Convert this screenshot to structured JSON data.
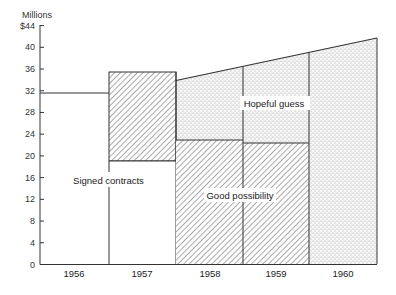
{
  "chart_data": {
    "type": "bar",
    "title": "",
    "xlabel": "",
    "ylabel": "Millions",
    "ylim": [
      0,
      44
    ],
    "y_ticks": [
      "0",
      "4",
      "8",
      "12",
      "16",
      "20",
      "24",
      "28",
      "32",
      "36",
      "40",
      "$44"
    ],
    "categories": [
      "1956",
      "1957",
      "1958",
      "1959",
      "1960"
    ],
    "grid": false,
    "legend": "none (inline annotations)",
    "series": [
      {
        "name": "Signed contracts",
        "pattern": "white",
        "values": [
          31.5,
          19,
          0,
          0,
          0
        ]
      },
      {
        "name": "Good possibility",
        "pattern": "diagonal-hatch",
        "values": [
          0,
          16.4,
          22.8,
          22.3,
          0
        ]
      },
      {
        "name": "Hopeful guess",
        "pattern": "stipple",
        "values": [
          0,
          0,
          "22.8→36.4 (sloped top from 33.8 to 41.6)",
          "22.3→38.8",
          "0→41.6"
        ]
      }
    ],
    "totals_approx": [
      31.5,
      35.4,
      33.8,
      38.8,
      41.6
    ],
    "annotations": [
      "Signed contracts",
      "Good possibility",
      "Hopeful guess"
    ]
  },
  "axis": {
    "unit_label": "Millions",
    "ticks": [
      {
        "v": 0,
        "label": "0"
      },
      {
        "v": 4,
        "label": "4"
      },
      {
        "v": 8,
        "label": "8"
      },
      {
        "v": 12,
        "label": "12"
      },
      {
        "v": 16,
        "label": "16"
      },
      {
        "v": 20,
        "label": "20"
      },
      {
        "v": 24,
        "label": "24"
      },
      {
        "v": 28,
        "label": "28"
      },
      {
        "v": 32,
        "label": "32"
      },
      {
        "v": 36,
        "label": "36"
      },
      {
        "v": 40,
        "label": "40"
      },
      {
        "v": 44,
        "label": "$44"
      }
    ]
  },
  "years": [
    "1956",
    "1957",
    "1958",
    "1959",
    "1960"
  ],
  "annotations": {
    "signed": "Signed contracts",
    "good": "Good possibility",
    "hopeful": "Hopeful guess"
  }
}
